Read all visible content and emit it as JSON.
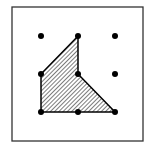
{
  "diagram": {
    "frame": {
      "x": 12,
      "y": 7,
      "width": 131,
      "height": 134,
      "stroke": "#333333"
    },
    "grid": {
      "columns": [
        41,
        78,
        115
      ],
      "rows": [
        36,
        74,
        112
      ],
      "dot_color": "#000000",
      "dot_radius": 3,
      "points": [
        {
          "col": 0,
          "row": 0
        },
        {
          "col": 1,
          "row": 0
        },
        {
          "col": 2,
          "row": 0
        },
        {
          "col": 0,
          "row": 1
        },
        {
          "col": 1,
          "row": 1
        },
        {
          "col": 2,
          "row": 1
        },
        {
          "col": 0,
          "row": 2
        },
        {
          "col": 1,
          "row": 2
        },
        {
          "col": 2,
          "row": 2
        }
      ]
    },
    "shaded_polygon": {
      "vertices": [
        [
          78,
          36
        ],
        [
          78,
          74
        ],
        [
          115,
          112
        ],
        [
          41,
          112
        ],
        [
          41,
          74
        ]
      ],
      "fill": "hatched",
      "stroke": "#000000"
    }
  }
}
